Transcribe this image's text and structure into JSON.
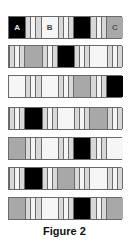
{
  "figure": {
    "caption": "Figure 2",
    "colors": {
      "black": "#000000",
      "white": "#f6f6f6",
      "gray": "#a8a8a8",
      "stripe_light": "#d8d8d8",
      "stripe_white": "#f4f4f4",
      "border": "#6a6a6a"
    },
    "rows": [
      {
        "cells": [
          {
            "type": "black",
            "label": "A"
          },
          {
            "type": "stripes",
            "label": ""
          },
          {
            "type": "white",
            "label": "B"
          },
          {
            "type": "stripes",
            "label": ""
          },
          {
            "type": "black",
            "label": ""
          },
          {
            "type": "stripes",
            "label": ""
          },
          {
            "type": "gray",
            "label": "C"
          }
        ]
      },
      {
        "cells": [
          {
            "type": "stripes",
            "label": ""
          },
          {
            "type": "gray",
            "label": ""
          },
          {
            "type": "stripes",
            "label": ""
          },
          {
            "type": "black",
            "label": ""
          },
          {
            "type": "stripes",
            "label": ""
          },
          {
            "type": "white",
            "label": ""
          },
          {
            "type": "stripes",
            "label": ""
          }
        ]
      },
      {
        "cells": [
          {
            "type": "white",
            "label": ""
          },
          {
            "type": "stripes",
            "label": ""
          },
          {
            "type": "white",
            "label": ""
          },
          {
            "type": "stripes",
            "label": ""
          },
          {
            "type": "gray",
            "label": ""
          },
          {
            "type": "stripes",
            "label": ""
          },
          {
            "type": "black",
            "label": ""
          }
        ]
      },
      {
        "cells": [
          {
            "type": "stripes",
            "label": ""
          },
          {
            "type": "black",
            "label": ""
          },
          {
            "type": "stripes",
            "label": ""
          },
          {
            "type": "white",
            "label": ""
          },
          {
            "type": "stripes",
            "label": ""
          },
          {
            "type": "gray",
            "label": ""
          },
          {
            "type": "stripes",
            "label": ""
          }
        ]
      },
      {
        "cells": [
          {
            "type": "gray",
            "label": ""
          },
          {
            "type": "stripes",
            "label": ""
          },
          {
            "type": "white",
            "label": ""
          },
          {
            "type": "stripes",
            "label": ""
          },
          {
            "type": "black",
            "label": ""
          },
          {
            "type": "stripes",
            "label": ""
          },
          {
            "type": "white",
            "label": ""
          }
        ]
      },
      {
        "cells": [
          {
            "type": "stripes",
            "label": ""
          },
          {
            "type": "black",
            "label": ""
          },
          {
            "type": "stripes",
            "label": ""
          },
          {
            "type": "gray",
            "label": ""
          },
          {
            "type": "stripes",
            "label": ""
          },
          {
            "type": "white",
            "label": ""
          },
          {
            "type": "stripes",
            "label": ""
          }
        ]
      },
      {
        "cells": [
          {
            "type": "gray",
            "label": ""
          },
          {
            "type": "stripes",
            "label": ""
          },
          {
            "type": "white",
            "label": ""
          },
          {
            "type": "stripes",
            "label": ""
          },
          {
            "type": "black",
            "label": ""
          },
          {
            "type": "stripes",
            "label": ""
          },
          {
            "type": "gray",
            "label": ""
          }
        ]
      }
    ]
  }
}
